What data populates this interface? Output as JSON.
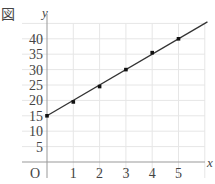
{
  "figure": {
    "label": "図"
  },
  "chart_data": {
    "type": "line",
    "title": "",
    "xlabel": "x",
    "ylabel": "y",
    "origin_label": "O",
    "x_ticks": [
      1,
      2,
      3,
      4,
      5
    ],
    "y_ticks": [
      5,
      10,
      15,
      20,
      25,
      30,
      35,
      40
    ],
    "xlim": [
      0,
      6.1
    ],
    "ylim": [
      0,
      45
    ],
    "grid": true,
    "series": [
      {
        "name": "points",
        "style": "scatter",
        "x": [
          0,
          1,
          2,
          3,
          4,
          5
        ],
        "y": [
          15,
          19.5,
          24.5,
          30,
          35.5,
          40
        ]
      },
      {
        "name": "fit-line",
        "style": "line",
        "x": [
          0,
          6.1
        ],
        "y": [
          15,
          45.5
        ]
      }
    ]
  }
}
